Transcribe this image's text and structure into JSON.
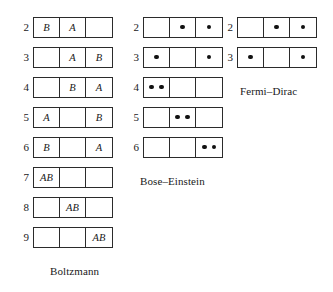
{
  "figure": {
    "title": "",
    "columns": [
      {
        "id": "boltzmann",
        "caption": "Boltzmann",
        "caption_left": 38,
        "caption_top": 264,
        "rows": [
          {
            "number": "2",
            "top": 16,
            "cells": [
              {
                "type": "text",
                "text": "B"
              },
              {
                "type": "text",
                "text": "A"
              },
              {
                "type": "empty",
                "text": ""
              }
            ]
          },
          {
            "number": "3",
            "top": 46,
            "cells": [
              {
                "type": "empty",
                "text": ""
              },
              {
                "type": "text",
                "text": "A"
              },
              {
                "type": "text",
                "text": "B"
              }
            ]
          },
          {
            "number": "4",
            "top": 76,
            "cells": [
              {
                "type": "empty",
                "text": ""
              },
              {
                "type": "text",
                "text": "B"
              },
              {
                "type": "text",
                "text": "A"
              }
            ]
          },
          {
            "number": "5",
            "top": 106,
            "cells": [
              {
                "type": "text",
                "text": "A"
              },
              {
                "type": "empty",
                "text": ""
              },
              {
                "type": "text",
                "text": "B"
              }
            ]
          },
          {
            "number": "6",
            "top": 136,
            "cells": [
              {
                "type": "text",
                "text": "B"
              },
              {
                "type": "empty",
                "text": ""
              },
              {
                "type": "text",
                "text": "A"
              }
            ]
          },
          {
            "number": "7",
            "top": 166,
            "cells": [
              {
                "type": "text",
                "text": "AB"
              },
              {
                "type": "empty",
                "text": ""
              },
              {
                "type": "empty",
                "text": ""
              }
            ]
          },
          {
            "number": "8",
            "top": 196,
            "cells": [
              {
                "type": "empty",
                "text": ""
              },
              {
                "type": "text",
                "text": "AB"
              },
              {
                "type": "empty",
                "text": ""
              }
            ]
          },
          {
            "number": "9",
            "top": 226,
            "cells": [
              {
                "type": "empty",
                "text": ""
              },
              {
                "type": "empty",
                "text": ""
              },
              {
                "type": "text",
                "text": "AB"
              }
            ]
          }
        ]
      },
      {
        "id": "bose",
        "caption": "Bose–Einstein",
        "caption_left": 18,
        "caption_top": 174,
        "rows": [
          {
            "number": "2",
            "top": 16,
            "cells": [
              {
                "type": "dots",
                "count": 0
              },
              {
                "type": "dots",
                "count": 1
              },
              {
                "type": "dots",
                "count": 1
              }
            ]
          },
          {
            "number": "3",
            "top": 46,
            "cells": [
              {
                "type": "dots",
                "count": 1
              },
              {
                "type": "dots",
                "count": 0
              },
              {
                "type": "dots",
                "count": 1
              }
            ]
          },
          {
            "number": "4",
            "top": 76,
            "cells": [
              {
                "type": "dots",
                "count": 2
              },
              {
                "type": "dots",
                "count": 0
              },
              {
                "type": "dots",
                "count": 0
              }
            ]
          },
          {
            "number": "5",
            "top": 106,
            "cells": [
              {
                "type": "dots",
                "count": 0
              },
              {
                "type": "dots",
                "count": 2
              },
              {
                "type": "dots",
                "count": 0
              }
            ]
          },
          {
            "number": "6",
            "top": 136,
            "cells": [
              {
                "type": "dots",
                "count": 0
              },
              {
                "type": "dots",
                "count": 0
              },
              {
                "type": "dots",
                "count": 2
              }
            ]
          }
        ]
      },
      {
        "id": "fermi",
        "caption": "Fermi–Dirac",
        "caption_left": 24,
        "caption_top": 84,
        "rows": [
          {
            "number": "2",
            "top": 16,
            "cells": [
              {
                "type": "dots",
                "count": 0
              },
              {
                "type": "dots",
                "count": 1
              },
              {
                "type": "dots",
                "count": 1
              }
            ]
          },
          {
            "number": "3",
            "top": 46,
            "cells": [
              {
                "type": "dots",
                "count": 1
              },
              {
                "type": "dots",
                "count": 0
              },
              {
                "type": "dots",
                "count": 1
              }
            ]
          }
        ]
      }
    ]
  }
}
